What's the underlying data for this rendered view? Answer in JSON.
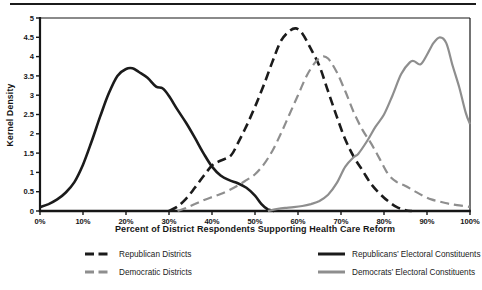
{
  "figure": {
    "background": "#ffffff",
    "top_rule_color": "#1b1b1b"
  },
  "chart_data": {
    "type": "line",
    "title": "",
    "xlabel": "Percent of District Respondents Supporting Health Care Reform",
    "ylabel": "Kernel Density",
    "xlim": [
      0,
      100
    ],
    "ylim": [
      0,
      5
    ],
    "grid": false,
    "legend_position": "bottom",
    "axis_color": "#161616",
    "x_ticks": {
      "values": [
        0,
        10,
        20,
        30,
        40,
        50,
        60,
        70,
        80,
        90,
        100
      ],
      "labels": [
        "0%",
        "10%",
        "20%",
        "30%",
        "40%",
        "50%",
        "60%",
        "70%",
        "80%",
        "90%",
        "100%"
      ]
    },
    "y_ticks": {
      "values": [
        0,
        0.5,
        1,
        1.5,
        2,
        2.5,
        3,
        3.5,
        4,
        4.5,
        5
      ],
      "labels": [
        "0",
        "0.5",
        "1",
        "1.5",
        "2",
        "2.5",
        "3",
        "3.5",
        "4",
        "4.5",
        "5"
      ]
    },
    "series": [
      {
        "id": "republican-districts",
        "name": "Republican Districts",
        "color": "#1b1b1b",
        "dash": "9,5",
        "width": 2.6,
        "points": [
          [
            30,
            0
          ],
          [
            32,
            0.12
          ],
          [
            34,
            0.32
          ],
          [
            36,
            0.6
          ],
          [
            38,
            0.9
          ],
          [
            40,
            1.18
          ],
          [
            41.5,
            1.28
          ],
          [
            43,
            1.35
          ],
          [
            44.5,
            1.45
          ],
          [
            46,
            1.75
          ],
          [
            48,
            2.2
          ],
          [
            50,
            2.7
          ],
          [
            52,
            3.25
          ],
          [
            54,
            3.85
          ],
          [
            56,
            4.4
          ],
          [
            58,
            4.66
          ],
          [
            59.5,
            4.73
          ],
          [
            61,
            4.6
          ],
          [
            63,
            4.2
          ],
          [
            65,
            3.75
          ],
          [
            67,
            3.1
          ],
          [
            69,
            2.45
          ],
          [
            71,
            1.85
          ],
          [
            73,
            1.4
          ],
          [
            75,
            1.05
          ],
          [
            77,
            0.7
          ],
          [
            79,
            0.45
          ],
          [
            81,
            0.25
          ],
          [
            83,
            0.1
          ],
          [
            85,
            0.02
          ],
          [
            86.5,
            0
          ]
        ]
      },
      {
        "id": "democratic-districts",
        "name": "Democratic Districts",
        "color": "#8e8e8e",
        "dash": "9,5",
        "width": 2.2,
        "points": [
          [
            32,
            0
          ],
          [
            34,
            0.08
          ],
          [
            36,
            0.18
          ],
          [
            38,
            0.28
          ],
          [
            40,
            0.36
          ],
          [
            42,
            0.44
          ],
          [
            44,
            0.54
          ],
          [
            46,
            0.66
          ],
          [
            48,
            0.8
          ],
          [
            50,
            0.95
          ],
          [
            52,
            1.2
          ],
          [
            54,
            1.55
          ],
          [
            56,
            2.0
          ],
          [
            58,
            2.5
          ],
          [
            60,
            3.0
          ],
          [
            62,
            3.5
          ],
          [
            64,
            3.85
          ],
          [
            65.5,
            4.0
          ],
          [
            67,
            3.95
          ],
          [
            69,
            3.6
          ],
          [
            71,
            3.1
          ],
          [
            73,
            2.55
          ],
          [
            75,
            2.1
          ],
          [
            77,
            1.75
          ],
          [
            79,
            1.35
          ],
          [
            81,
            0.95
          ],
          [
            83,
            0.75
          ],
          [
            85,
            0.65
          ],
          [
            87,
            0.52
          ],
          [
            89,
            0.4
          ],
          [
            91,
            0.3
          ],
          [
            93,
            0.24
          ],
          [
            95,
            0.19
          ],
          [
            97,
            0.15
          ],
          [
            100,
            0.11
          ]
        ]
      },
      {
        "id": "republicans-electoral-constituents",
        "name": "Republicans’ Electoral Constituents",
        "color": "#1b1b1b",
        "dash": "",
        "width": 2.6,
        "points": [
          [
            0,
            0.1
          ],
          [
            2,
            0.18
          ],
          [
            4,
            0.3
          ],
          [
            6,
            0.48
          ],
          [
            8,
            0.75
          ],
          [
            10,
            1.2
          ],
          [
            12,
            1.8
          ],
          [
            14,
            2.45
          ],
          [
            16,
            3.05
          ],
          [
            18,
            3.5
          ],
          [
            20,
            3.68
          ],
          [
            21.5,
            3.7
          ],
          [
            23,
            3.6
          ],
          [
            25,
            3.45
          ],
          [
            27,
            3.22
          ],
          [
            28.5,
            3.18
          ],
          [
            30,
            2.98
          ],
          [
            32,
            2.62
          ],
          [
            34,
            2.28
          ],
          [
            36,
            1.9
          ],
          [
            38,
            1.5
          ],
          [
            40,
            1.15
          ],
          [
            42,
            0.92
          ],
          [
            44,
            0.8
          ],
          [
            46,
            0.72
          ],
          [
            48,
            0.6
          ],
          [
            50,
            0.4
          ],
          [
            51.5,
            0.18
          ],
          [
            53,
            0.04
          ],
          [
            54.5,
            0
          ]
        ]
      },
      {
        "id": "democrats-electoral-constituents",
        "name": "Democrats’ Electoral Constituents",
        "color": "#8e8e8e",
        "dash": "",
        "width": 2.2,
        "points": [
          [
            53,
            0
          ],
          [
            55,
            0.05
          ],
          [
            57,
            0.08
          ],
          [
            59,
            0.1
          ],
          [
            61,
            0.13
          ],
          [
            63,
            0.18
          ],
          [
            65,
            0.26
          ],
          [
            67,
            0.42
          ],
          [
            69,
            0.72
          ],
          [
            71,
            1.15
          ],
          [
            73,
            1.4
          ],
          [
            74,
            1.48
          ],
          [
            76,
            1.8
          ],
          [
            78,
            2.18
          ],
          [
            80,
            2.5
          ],
          [
            82,
            3.0
          ],
          [
            84,
            3.55
          ],
          [
            86,
            3.85
          ],
          [
            87,
            3.88
          ],
          [
            88.5,
            3.8
          ],
          [
            90,
            4.05
          ],
          [
            91.5,
            4.35
          ],
          [
            93,
            4.5
          ],
          [
            94.5,
            4.35
          ],
          [
            96,
            3.75
          ],
          [
            97.5,
            3.2
          ],
          [
            99,
            2.55
          ],
          [
            100,
            2.25
          ]
        ]
      }
    ]
  }
}
